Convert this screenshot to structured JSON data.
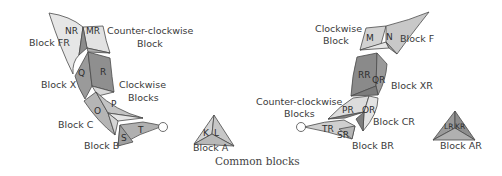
{
  "caption": "Common blocks",
  "colors": {
    "light": "#e6e6e6",
    "mid": "#b5b5b5",
    "dark": "#8d8d8d",
    "line": "#4a4a4a",
    "text": "#3a3a3a"
  },
  "left_spine": {
    "labels": {
      "block_fr": "Block FR",
      "ccw_block_1": "Counter-clockwise",
      "ccw_block_2": "Block",
      "block_x": "Block X",
      "cw_blocks_1": "Clockwise",
      "cw_blocks_2": "Blocks",
      "block_c": "Block C",
      "block_b": "Block B"
    },
    "segments": {
      "nr": "NR",
      "mr": "MR",
      "q": "Q",
      "r": "R",
      "o": "O",
      "p": "P",
      "s": "S",
      "t": "T"
    }
  },
  "block_a": {
    "label": "Block A",
    "segments": {
      "k": "K",
      "l": "L"
    }
  },
  "right_spine": {
    "labels": {
      "cw_block_1": "Clockwise",
      "cw_block_2": "Block",
      "block_f": "Block F",
      "block_xr": "Block XR",
      "ccw_blocks_1": "Counter-clockwise",
      "ccw_blocks_2": "Blocks",
      "block_cr": "Block CR",
      "block_br": "Block BR"
    },
    "segments": {
      "m": "M",
      "n": "N",
      "rr": "RR",
      "qr": "QR",
      "pr": "PR",
      "or": "OR",
      "tr": "TR",
      "sr": "SR"
    }
  },
  "block_ar": {
    "label": "Block AR",
    "segments": {
      "lr": "LR",
      "kr": "KR"
    }
  }
}
